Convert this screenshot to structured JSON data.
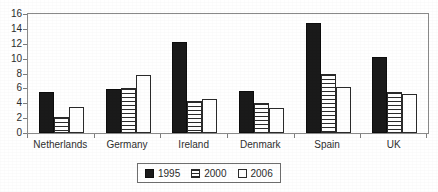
{
  "chart_data": {
    "type": "bar",
    "title": "",
    "subtitle": "",
    "xlabel": "",
    "ylabel": "",
    "ylim": [
      0,
      16
    ],
    "ytick_step": 2,
    "yticks": [
      16,
      14,
      12,
      10,
      8,
      6,
      4,
      2,
      0
    ],
    "grid": false,
    "legend_position": "bottom-center",
    "categories": [
      "Netherlands",
      "Germany",
      "Ireland",
      "Denmark",
      "Spain",
      "UK"
    ],
    "series": [
      {
        "name": "1995",
        "pattern": "solid-black",
        "color": "#1a1a1a",
        "values": [
          5.5,
          5.9,
          12.2,
          5.6,
          14.8,
          10.2
        ]
      },
      {
        "name": "2000",
        "pattern": "horizontal-hatch",
        "color": "#2a2a2a",
        "values": [
          2.2,
          6.1,
          4.3,
          4.0,
          8.0,
          5.5
        ]
      },
      {
        "name": "2006",
        "pattern": "white-outline",
        "color": "#ffffff",
        "values": [
          3.5,
          7.8,
          4.6,
          3.3,
          6.2,
          5.2
        ]
      }
    ]
  },
  "legend": {
    "entries": [
      {
        "label": "1995"
      },
      {
        "label": "2000"
      },
      {
        "label": "2006"
      }
    ]
  },
  "axis": {
    "y_labels": [
      "16",
      "14",
      "12",
      "10",
      "8",
      "6",
      "4",
      "2",
      "0"
    ]
  }
}
